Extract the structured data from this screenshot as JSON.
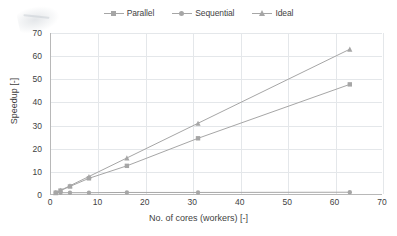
{
  "chart_data": {
    "type": "line",
    "title": "",
    "xlabel": "No. of cores (workers) [-]",
    "ylabel": "Speedup [-]",
    "xlim": [
      0,
      70
    ],
    "ylim": [
      0,
      70
    ],
    "xticks": [
      0,
      10,
      20,
      30,
      40,
      50,
      60,
      70
    ],
    "yticks": [
      0,
      10,
      20,
      30,
      40,
      50,
      60,
      70
    ],
    "grid": true,
    "legend_position": "top-center",
    "x": [
      1,
      2,
      4,
      8,
      16,
      31,
      63
    ],
    "series": [
      {
        "name": "Parallel",
        "marker": "square",
        "color": "#a6a6a6",
        "values": [
          1.0,
          1.9,
          3.7,
          7.2,
          12.6,
          24.5,
          47.8
        ]
      },
      {
        "name": "Sequential",
        "marker": "circle",
        "color": "#a6a6a6",
        "values": [
          1.0,
          1.0,
          1.0,
          1.0,
          1.1,
          1.1,
          1.2
        ]
      },
      {
        "name": "Ideal",
        "marker": "triangle",
        "color": "#a6a6a6",
        "values": [
          1,
          2,
          4,
          8,
          16,
          31,
          63
        ]
      }
    ]
  },
  "legend": {
    "items": [
      {
        "label": "Parallel",
        "marker": "square"
      },
      {
        "label": "Sequential",
        "marker": "circle"
      },
      {
        "label": "Ideal",
        "marker": "triangle"
      }
    ]
  },
  "axes": {
    "x_tick_labels": [
      "0",
      "10",
      "20",
      "30",
      "40",
      "50",
      "60",
      "70"
    ],
    "y_tick_labels": [
      "0",
      "10",
      "20",
      "30",
      "40",
      "50",
      "60",
      "70"
    ],
    "x_title": "No. of cores (workers) [-]",
    "y_title": "Speedup [-]"
  },
  "colors": {
    "series": "#a6a6a6",
    "grid": "#e4e7ea",
    "axis": "#b8b8b8",
    "text": "#3f3f3f",
    "background": "#ffffff"
  }
}
